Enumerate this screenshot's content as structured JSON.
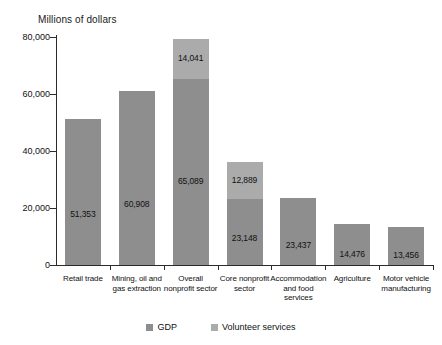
{
  "chart_data": {
    "type": "bar",
    "title": "Millions of dollars",
    "xlabel": "",
    "ylabel": "Millions of dollars",
    "ylim": [
      0,
      80000
    ],
    "ytick_labels": [
      "0",
      "20,000",
      "40,000",
      "60,000",
      "80,000"
    ],
    "ytick_values": [
      0,
      20000,
      40000,
      60000,
      80000
    ],
    "grid": false,
    "stacked": true,
    "legend_position": "bottom",
    "categories": [
      "Retail trade",
      "Mining, oil and gas extraction",
      "Overall nonprofit sector",
      "Core nonprofit sector",
      "Accommodation and food services",
      "Agriculture",
      "Motor vehicle manufacturing"
    ],
    "category_lines": [
      [
        "Retail trade"
      ],
      [
        "Mining, oil and",
        "gas extraction"
      ],
      [
        "Overall",
        "nonprofit sector"
      ],
      [
        "Core nonprofit",
        "sector"
      ],
      [
        "Accommodation",
        "and food",
        "services"
      ],
      [
        "Agriculture"
      ],
      [
        "Motor vehicle",
        "manufacturing"
      ]
    ],
    "series": [
      {
        "name": "GDP",
        "color": "#8e8e8e",
        "values": [
          51353,
          60908,
          65089,
          23148,
          23437,
          14476,
          13456
        ],
        "labels": [
          "51,353",
          "60,908",
          "65,089",
          "23,148",
          "23,437",
          "14,476",
          "13,456"
        ]
      },
      {
        "name": "Volunteer services",
        "color": "#ababab",
        "values": [
          0,
          0,
          14041,
          12889,
          0,
          0,
          0
        ],
        "labels": [
          "",
          "",
          "14,041",
          "12,889",
          "",
          "",
          ""
        ]
      }
    ],
    "legend": [
      {
        "label": "GDP",
        "color": "#8e8e8e"
      },
      {
        "label": "Volunteer services",
        "color": "#ababab"
      }
    ]
  }
}
